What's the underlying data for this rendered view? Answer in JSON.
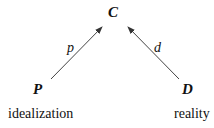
{
  "diagram": {
    "nodes": [
      {
        "id": "C",
        "label": "C"
      },
      {
        "id": "P",
        "label": "P",
        "caption": "idealization"
      },
      {
        "id": "D",
        "label": "D",
        "caption": "reality"
      }
    ],
    "edges": [
      {
        "from": "P",
        "to": "C",
        "label": "p"
      },
      {
        "from": "D",
        "to": "C",
        "label": "d"
      }
    ]
  },
  "labels": {
    "C": "C",
    "P": "P",
    "D": "D",
    "p": "p",
    "d": "d",
    "idealization": "idealization",
    "reality": "reality"
  },
  "colors": {
    "line": "#333333",
    "text": "#111111"
  }
}
